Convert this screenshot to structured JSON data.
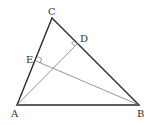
{
  "diagram": {
    "type": "triangle-altitudes",
    "points": {
      "A": {
        "label": "A",
        "x": 17,
        "y": 105,
        "lx": 11,
        "ly": 117
      },
      "B": {
        "label": "B",
        "x": 139,
        "y": 105,
        "lx": 137,
        "ly": 117
      },
      "C": {
        "label": "C",
        "x": 52,
        "y": 18,
        "lx": 48,
        "ly": 15
      },
      "D": {
        "label": "D",
        "x": 78,
        "y": 43,
        "lx": 80,
        "ly": 42
      },
      "E": {
        "label": "E",
        "x": 36,
        "y": 61,
        "lx": 26,
        "ly": 63
      }
    },
    "edges": [
      {
        "from": "A",
        "to": "B"
      },
      {
        "from": "B",
        "to": "C"
      },
      {
        "from": "C",
        "to": "A"
      }
    ],
    "altitudes": [
      {
        "from": "A",
        "foot": "D",
        "on": "BC",
        "right_angle_marker": true
      },
      {
        "from": "B",
        "foot": "E",
        "on": "AC",
        "right_angle_marker": true
      }
    ],
    "colors": {
      "edge": "#2a2a2a",
      "altitude": "#7a7a7a",
      "label": "#333333",
      "background": "#ffffff"
    }
  }
}
